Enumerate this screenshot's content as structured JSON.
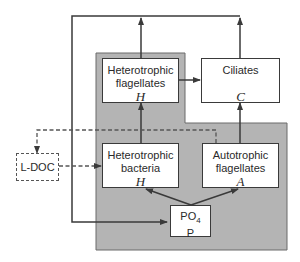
{
  "diagram": {
    "colors": {
      "background": "#ffffff",
      "shaded_region": "#b4b4b4",
      "lines": "#3a3a3a",
      "box_fill": "#ffffff"
    },
    "nodes": {
      "het_flag": {
        "line1": "Heterotrophic",
        "line2": "flagellates",
        "symbol": "H"
      },
      "ciliates": {
        "line1": "Ciliates",
        "symbol": "C"
      },
      "het_bact": {
        "line1": "Heterotrophic",
        "line2": "bacteria",
        "symbol": "H"
      },
      "auto_flag": {
        "line1": "Autotrophic",
        "line2": "flagellates",
        "symbol": "A"
      },
      "po4": {
        "line1": "PO",
        "sub": "4",
        "symbol": "P"
      },
      "ldoc": {
        "label": "L-DOC"
      }
    },
    "edges": [
      {
        "from": "het_bact",
        "to": "het_flag",
        "style": "solid"
      },
      {
        "from": "het_flag",
        "to": "ciliates",
        "style": "solid"
      },
      {
        "from": "auto_flag",
        "to": "ciliates",
        "style": "solid"
      },
      {
        "from": "po4",
        "to": "het_bact",
        "style": "solid"
      },
      {
        "from": "po4",
        "to": "auto_flag",
        "style": "solid"
      },
      {
        "from": "het_flag",
        "to": "po4",
        "style": "solid",
        "note": "recycling loop via outer line"
      },
      {
        "from": "ciliates",
        "to": "po4",
        "style": "solid",
        "note": "recycling loop via outer line"
      },
      {
        "from": "auto_flag",
        "to": "ldoc",
        "style": "dashed"
      },
      {
        "from": "ldoc",
        "to": "het_bact",
        "style": "dashed"
      }
    ]
  }
}
